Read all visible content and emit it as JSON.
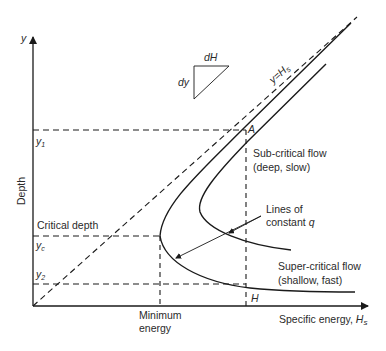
{
  "diagram": {
    "axes": {
      "y_symbol": "y",
      "y_label": "Depth",
      "x_label": "Specific energy, ",
      "x_label_symbol": "H",
      "x_label_subscript": "s"
    },
    "depth_labels": {
      "y1": "y",
      "y1_sub": "1",
      "yc": "y",
      "yc_sub": "c",
      "y2": "y",
      "y2_sub": "2"
    },
    "annotations": {
      "critical_depth": "Critical depth",
      "minimum_energy_line1": "Minimum",
      "minimum_energy_line2": "energy",
      "point_a": "A",
      "point_h": "H",
      "diagonal_label": "y=H",
      "diagonal_label_sub": "s",
      "slope_dh": "dH",
      "slope_dy": "dy",
      "subcritical_line1": "Sub-critical flow",
      "subcritical_line2": "(deep, slow)",
      "supercritical_line1": "Super-critical flow",
      "supercritical_line2": "(shallow, fast)",
      "constant_q_line1": "Lines of",
      "constant_q_line2": "constant ",
      "constant_q_symbol": "q"
    }
  }
}
